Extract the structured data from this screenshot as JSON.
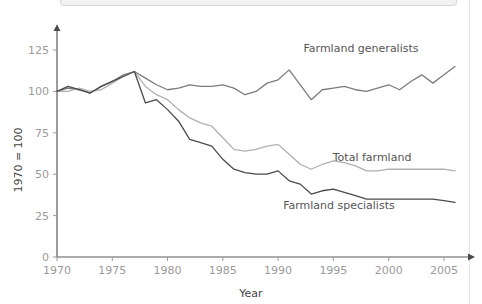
{
  "panel": {
    "top_box_label": ""
  },
  "chart_data": {
    "type": "line",
    "title": "",
    "xlabel": "Year",
    "ylabel": "1970 = 100",
    "xlim": [
      1970,
      2006
    ],
    "ylim": [
      0,
      137
    ],
    "grid": false,
    "legend_position": "inline-end-of-line",
    "xticks": [
      1970,
      1975,
      1980,
      1985,
      1990,
      1995,
      2000,
      2005
    ],
    "xtick_labels": [
      "1970",
      "1975",
      "1980",
      "1985",
      "1990",
      "1995",
      "2000",
      "2005"
    ],
    "yticks": [
      0,
      25,
      50,
      75,
      100,
      125
    ],
    "ytick_labels": [
      "0",
      "25",
      "50",
      "75",
      "100",
      "125"
    ],
    "x": [
      1970,
      1971,
      1972,
      1973,
      1974,
      1975,
      1976,
      1977,
      1978,
      1979,
      1980,
      1981,
      1982,
      1983,
      1984,
      1985,
      1986,
      1987,
      1988,
      1989,
      1990,
      1991,
      1992,
      1993,
      1994,
      1995,
      1996,
      1997,
      1998,
      1999,
      2000,
      2001,
      2002,
      2003,
      2004,
      2005,
      2006
    ],
    "series": [
      {
        "name": "Farmland generalists",
        "color": "#7c7c7c",
        "label_x": 1997.5,
        "label_y": 124,
        "values": [
          100,
          102,
          101,
          99,
          103,
          106,
          110,
          112,
          108,
          104,
          101,
          102,
          104,
          103,
          103,
          104,
          102,
          98,
          100,
          105,
          107,
          113,
          104,
          95,
          101,
          102,
          103,
          101,
          100,
          102,
          104,
          101,
          106,
          110,
          105,
          110,
          115
        ]
      },
      {
        "name": "Total farmland",
        "color": "#b0b0b0",
        "label_x": 1998.5,
        "label_y": 58,
        "values": [
          100,
          100,
          102,
          100,
          101,
          105,
          109,
          112,
          103,
          98,
          95,
          89,
          84,
          81,
          79,
          72,
          65,
          64,
          65,
          67,
          68,
          62,
          56,
          53,
          56,
          58,
          57,
          55,
          52,
          52,
          53,
          53,
          53,
          53,
          53,
          53,
          52
        ]
      },
      {
        "name": "Farmland specialists",
        "color": "#4a4a4a",
        "label_x": 1995.5,
        "label_y": 29,
        "values": [
          100,
          103,
          101,
          99,
          103,
          106,
          109,
          112,
          93,
          95,
          89,
          82,
          71,
          69,
          67,
          59,
          53,
          51,
          50,
          50,
          52,
          46,
          44,
          38,
          40,
          41,
          39,
          37,
          35,
          35,
          35,
          35,
          35,
          35,
          35,
          34,
          33
        ]
      }
    ]
  },
  "axis": {
    "y_axis_title": "1970 = 100",
    "x_axis_title": "Year"
  }
}
